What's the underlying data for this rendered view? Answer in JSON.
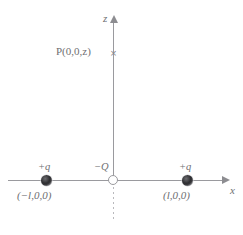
{
  "diagram": {
    "axes": {
      "x_label": "x",
      "z_label": "z"
    },
    "point": {
      "label": "P(0,0,z)",
      "marker_glyph": "×",
      "marker_name": "x-cross-marker"
    },
    "charges": [
      {
        "id": "charge-left",
        "symbol": "+q",
        "coordinate": "(−l,0,0)",
        "sign": "positive",
        "fill": "#2e2e31"
      },
      {
        "id": "charge-origin",
        "symbol": "−Q",
        "coordinate": "",
        "sign": "negative",
        "fill": "#ffffff"
      },
      {
        "id": "charge-right",
        "symbol": "+q",
        "coordinate": "(l,0,0)",
        "sign": "positive",
        "fill": "#2e2e31"
      }
    ],
    "colors": {
      "axis": "#9a9a9e",
      "text": "#6f6f72",
      "dashed": "#b9b9bd",
      "background": "#ffffff"
    }
  }
}
